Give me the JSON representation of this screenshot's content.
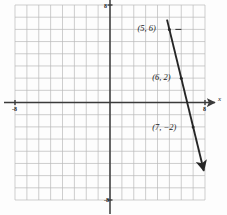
{
  "chart_data": {
    "type": "line",
    "title": "",
    "xlabel": "x",
    "ylabel": "",
    "xlim": [
      -8,
      8
    ],
    "ylim": [
      -8,
      8
    ],
    "grid": true,
    "legend": "none",
    "x_tick_labels": [
      {
        "value": -8,
        "text": "-8"
      },
      {
        "value": 8,
        "text": "8"
      }
    ],
    "y_tick_labels": [
      {
        "value": 8,
        "text": "8"
      },
      {
        "value": -8,
        "text": "-8"
      }
    ],
    "series": [
      {
        "name": "line",
        "slope": -4,
        "intercept": 26,
        "x": [
          4.8,
          7.9
        ],
        "y": [
          6.8,
          -5.6
        ],
        "arrow_start": true,
        "arrow_end": true,
        "color": "#262626"
      }
    ],
    "points": [
      {
        "x": 5,
        "y": 6,
        "label": "(5, 6)",
        "leader": true
      },
      {
        "x": 6,
        "y": 2,
        "label": "(6, 2)",
        "leader": false
      },
      {
        "x": 7,
        "y": -2,
        "label": "(7, −2)",
        "leader": false
      }
    ],
    "colors": {
      "grid": "#b9b9b9",
      "axis": "#3a3a3a",
      "line": "#262626",
      "background": "#fdfdfd",
      "text": "#1a1a1a"
    }
  },
  "labels": {
    "x_axis": "x",
    "x_left_tick": "-8",
    "x_right_tick": "8",
    "y_top_tick": "8",
    "y_bottom_tick": "-8",
    "point_1": "(5, 6)",
    "point_2": "(6, 2)",
    "point_3": "(7, −2)"
  }
}
